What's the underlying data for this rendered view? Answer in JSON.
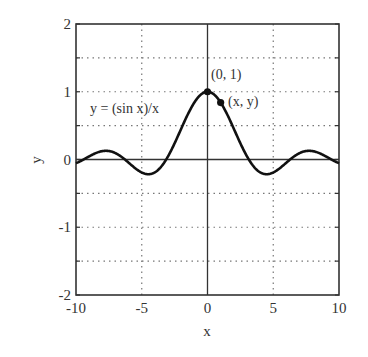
{
  "chart_data": {
    "type": "line",
    "title": "",
    "xlabel": "x",
    "ylabel": "y",
    "xlim": [
      -10,
      10
    ],
    "ylim": [
      -2,
      2
    ],
    "grid": true,
    "grid_style": "dotted",
    "x_ticks": [
      -10,
      -5,
      0,
      5,
      10
    ],
    "y_ticks": [
      -2,
      -1,
      0,
      1,
      2
    ],
    "x_tick_labels": [
      "-10",
      "-5",
      "0",
      "5",
      "10"
    ],
    "y_tick_labels": [
      "-2",
      "-1",
      "0",
      "1",
      "2"
    ],
    "y_minor_gridlines": [
      -1.5,
      -0.5,
      0.5,
      1.5
    ],
    "series": [
      {
        "name": "y = (sin x)/x",
        "function": "sin(x)/x",
        "x": [
          -10,
          -9,
          -8,
          -7,
          -6,
          -5,
          -4.49,
          -4,
          -3,
          -2,
          -1,
          0,
          1,
          2,
          3,
          4,
          4.49,
          5,
          6,
          7,
          7.73,
          8,
          9,
          10
        ],
        "values": [
          -0.054,
          0.046,
          0.124,
          0.094,
          -0.047,
          -0.192,
          -0.217,
          -0.189,
          0.047,
          0.455,
          0.841,
          1.0,
          0.841,
          0.455,
          0.047,
          -0.189,
          -0.217,
          -0.192,
          -0.047,
          0.094,
          0.128,
          0.124,
          0.046,
          -0.054
        ]
      }
    ],
    "annotations": [
      {
        "text": "y = (sin x)/x",
        "x": -6.5,
        "y": 0.5
      },
      {
        "text": "(0, 1)",
        "x": 0.2,
        "y": 1.35,
        "point": [
          0,
          1
        ]
      },
      {
        "text": "(x, y)",
        "x": 1.6,
        "y": 0.8,
        "point": [
          1.0,
          0.84
        ]
      }
    ],
    "legend": null
  },
  "labels": {
    "xlabel": "x",
    "ylabel": "y",
    "curve": "y = (sin x)/x",
    "point_origin": "(0, 1)",
    "point_generic": "(x, y)"
  }
}
